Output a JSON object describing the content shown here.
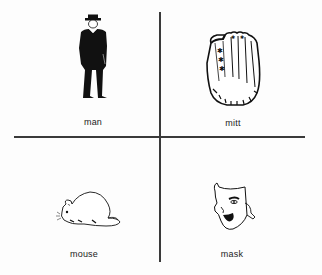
{
  "cards": [
    {
      "label": "man",
      "icon": "man-silhouette-icon"
    },
    {
      "label": "mitt",
      "icon": "baseball-mitt-icon"
    },
    {
      "label": "mouse",
      "icon": "mouse-icon"
    },
    {
      "label": "mask",
      "icon": "theater-mask-icon"
    }
  ],
  "colors": {
    "ink": "#111111",
    "background": "#fdfdfd",
    "divider": "#3a3a3a"
  }
}
